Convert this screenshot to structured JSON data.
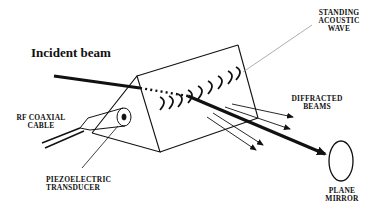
{
  "diagram": {
    "labels": {
      "incident_beam": "Incident beam",
      "standing_wave_line1": "STANDING",
      "standing_wave_line2": "ACOUSTIC",
      "standing_wave_line3": "WAVE",
      "diffracted_line1": "DIFFRACTED",
      "diffracted_line2": "BEAMS",
      "rf_line1": "RF COAXIAL",
      "rf_line2": "CABLE",
      "piezo_line1": "PIEZOELECTRIC",
      "piezo_line2": "TRANSDUCER",
      "mirror_line1": "PLANE",
      "mirror_line2": "MIRROR"
    },
    "colors": {
      "ink": "#111111",
      "leader": "#999999",
      "background": "#ffffff"
    }
  }
}
